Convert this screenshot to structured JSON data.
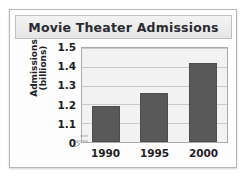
{
  "chart_data": {
    "type": "bar",
    "title": "Movie Theater Admissions",
    "xlabel": "",
    "ylabel": "Admissions (billions)",
    "ylabel_lines": [
      "Admissions",
      "(billions)"
    ],
    "categories": [
      "1990",
      "1995",
      "2000"
    ],
    "values": [
      1.19,
      1.26,
      1.42
    ],
    "ylim": [
      1.0,
      1.5
    ],
    "ytick_labels": [
      "1.5",
      "1.4",
      "1.3",
      "1.2",
      "1.1",
      "0"
    ],
    "ytick_values": [
      1.5,
      1.4,
      1.3,
      1.2,
      1.1,
      0
    ],
    "axis_break": true,
    "grid": true,
    "legend": "none",
    "bar_color": "#595959",
    "plot_background": "#f2f2f2",
    "title_background": "#ececec",
    "text_color": "#1f1f26"
  }
}
